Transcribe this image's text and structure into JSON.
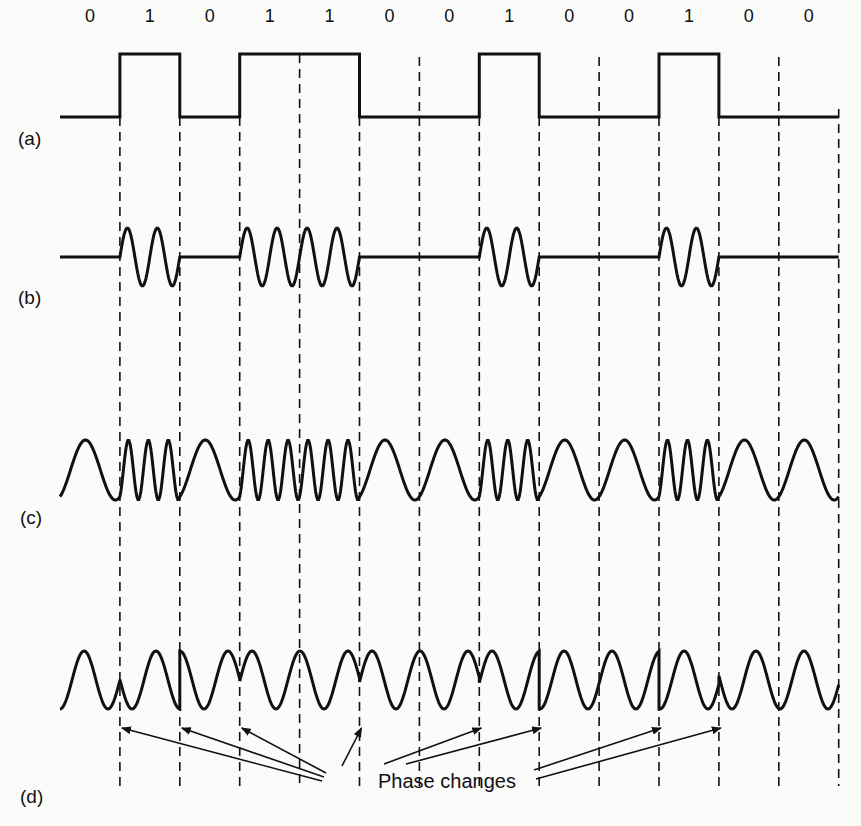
{
  "figure": {
    "bits": [
      0,
      1,
      0,
      1,
      1,
      0,
      0,
      1,
      0,
      0,
      1,
      0,
      0
    ],
    "bit_labels": [
      "0",
      "1",
      "0",
      "1",
      "1",
      "0",
      "0",
      "1",
      "0",
      "0",
      "1",
      "0",
      "0"
    ],
    "panels": [
      {
        "id": "a",
        "label": "(a)",
        "description": "binary signal"
      },
      {
        "id": "b",
        "label": "(b)",
        "description": "amplitude modulation"
      },
      {
        "id": "c",
        "label": "(c)",
        "description": "frequency modulation"
      },
      {
        "id": "d",
        "label": "(d)",
        "description": "phase modulation"
      }
    ],
    "annotation": {
      "text": "Phase changes",
      "arrow_targets_bit_boundaries": [
        1,
        2,
        3,
        5,
        7,
        8,
        10,
        11
      ]
    },
    "colors": {
      "ink": "#111111",
      "background": "#fbfbf9"
    }
  }
}
